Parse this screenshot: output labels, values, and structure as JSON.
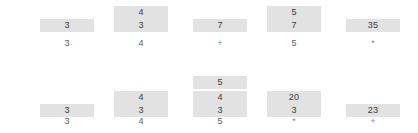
{
  "canvas": {
    "width": 418,
    "height": 133,
    "background": "#ffffff",
    "cell_fill": "#e2e2e2",
    "cell_text": "#3a3a3a",
    "token_text": "#5a5a5a",
    "operator_text": "#8a8a8a"
  },
  "rows": [
    {
      "name": "expression-trace-top",
      "columns": [
        {
          "x": 40,
          "token": "3",
          "is_operator": false,
          "stack": [
            "3"
          ]
        },
        {
          "x": 114,
          "token": "4",
          "is_operator": false,
          "stack": [
            "3",
            "4"
          ]
        },
        {
          "x": 193,
          "token": "+",
          "is_operator": true,
          "stack": [
            "7"
          ]
        },
        {
          "x": 267,
          "token": "5",
          "is_operator": false,
          "stack": [
            "7",
            "5"
          ]
        },
        {
          "x": 346,
          "token": "*",
          "is_operator": true,
          "stack": [
            "35"
          ]
        }
      ]
    },
    {
      "name": "expression-trace-bottom",
      "columns": [
        {
          "x": 40,
          "token": "3",
          "is_operator": false,
          "stack": [
            "3"
          ]
        },
        {
          "x": 114,
          "token": "4",
          "is_operator": false,
          "stack": [
            "3",
            "4"
          ]
        },
        {
          "x": 193,
          "token": "5",
          "is_operator": false,
          "stack": [
            "3",
            "4",
            "5"
          ]
        },
        {
          "x": 267,
          "token": "*",
          "is_operator": true,
          "stack": [
            "3",
            "20"
          ]
        },
        {
          "x": 346,
          "token": "+",
          "is_operator": true,
          "stack": [
            "23"
          ]
        }
      ]
    }
  ]
}
